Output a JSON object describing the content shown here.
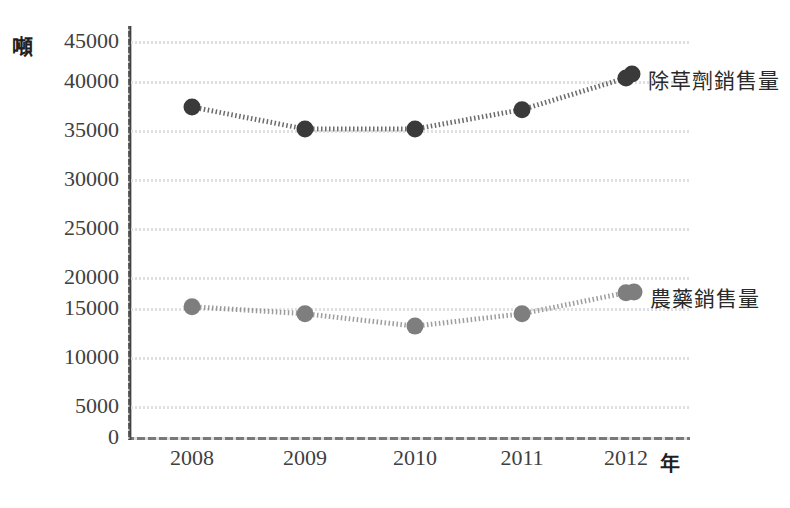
{
  "unit_label": "噸",
  "x_axis_title": "年",
  "axis": {
    "y_ticks": [
      "45000",
      "40000",
      "35000",
      "30000",
      "25000",
      "20000",
      "15000",
      "10000",
      "5000",
      "0"
    ],
    "x_ticks": [
      "2008",
      "2009",
      "2010",
      "2011",
      "2012"
    ]
  },
  "series_labels": {
    "herbicide": "除草劑銷售量",
    "pesticide": "農藥銷售量"
  },
  "colors": {
    "herbicide": "#3a3a3a",
    "pesticide": "#7e7e7e",
    "gridline": "#dedee2",
    "axis": "#3c3c3c",
    "background": "#ffffff"
  },
  "chart_data": {
    "type": "line",
    "title": "",
    "subtitle": "",
    "xlabel": "年",
    "ylabel": "噸",
    "categories": [
      "2008",
      "2009",
      "2010",
      "2011",
      "2012"
    ],
    "x": [
      2008,
      2009,
      2010,
      2011,
      2012
    ],
    "series": [
      {
        "name": "除草劑銷售量",
        "color": "#3a3a3a",
        "values": [
          37500,
          35000,
          35000,
          37200,
          40800
        ]
      },
      {
        "name": "農藥銷售量",
        "color": "#7e7e7e",
        "values": [
          14800,
          14000,
          12600,
          14000,
          16400
        ]
      }
    ],
    "ylim": [
      0,
      45000
    ],
    "ytick_step": 5000,
    "grid": true,
    "grid_axis": "y",
    "legend": "inline-right-labels",
    "marker": "circle",
    "linestyle": "dotted"
  }
}
